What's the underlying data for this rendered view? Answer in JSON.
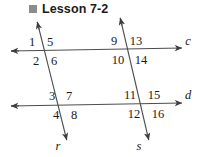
{
  "header": {
    "bullet_icon": "filled-square-bullet",
    "bullet_color": "#8c8c8c",
    "title": "Lesson 7-2"
  },
  "figure": {
    "stroke_color": "#4d4d4d",
    "label_color": "#1b1b1b",
    "lines": [
      {
        "name": "c",
        "label": "c",
        "kind": "horizontal-line",
        "label_x": 188,
        "label_y": 41,
        "x1": 10,
        "y1": 51,
        "x2": 183,
        "y2": 48,
        "arrow_start": true,
        "arrow_end": true
      },
      {
        "name": "d",
        "label": "d",
        "kind": "horizontal-line",
        "label_x": 188,
        "label_y": 95,
        "x1": 10,
        "y1": 106,
        "x2": 183,
        "y2": 103,
        "arrow_start": true,
        "arrow_end": true
      },
      {
        "name": "r",
        "label": "r",
        "kind": "transversal-line",
        "label_x": 58,
        "label_y": 146,
        "x1": 37,
        "y1": 21,
        "x2": 67,
        "y2": 141,
        "arrow_start": true,
        "arrow_end": true
      },
      {
        "name": "s",
        "label": "s",
        "kind": "transversal-line",
        "label_x": 139,
        "label_y": 146,
        "x1": 120,
        "y1": 17,
        "x2": 149,
        "y2": 141,
        "arrow_start": true,
        "arrow_end": true
      }
    ],
    "intersections": [
      {
        "name": "c-r",
        "angles": [
          {
            "n": "1",
            "x": 32,
            "y": 42
          },
          {
            "n": "5",
            "x": 50,
            "y": 42
          },
          {
            "n": "2",
            "x": 36,
            "y": 61
          },
          {
            "n": "6",
            "x": 54,
            "y": 61
          }
        ]
      },
      {
        "name": "c-s",
        "angles": [
          {
            "n": "9",
            "x": 114,
            "y": 41
          },
          {
            "n": "13",
            "x": 136,
            "y": 41
          },
          {
            "n": "10",
            "x": 118,
            "y": 60
          },
          {
            "n": "14",
            "x": 141,
            "y": 60
          }
        ]
      },
      {
        "name": "d-r",
        "angles": [
          {
            "n": "3",
            "x": 52,
            "y": 96
          },
          {
            "n": "7",
            "x": 69,
            "y": 96
          },
          {
            "n": "4",
            "x": 56,
            "y": 115
          },
          {
            "n": "8",
            "x": 74,
            "y": 115
          }
        ]
      },
      {
        "name": "d-s",
        "angles": [
          {
            "n": "11",
            "x": 130,
            "y": 95
          },
          {
            "n": "15",
            "x": 154,
            "y": 95
          },
          {
            "n": "12",
            "x": 134,
            "y": 114
          },
          {
            "n": "16",
            "x": 158,
            "y": 114
          }
        ]
      }
    ]
  }
}
